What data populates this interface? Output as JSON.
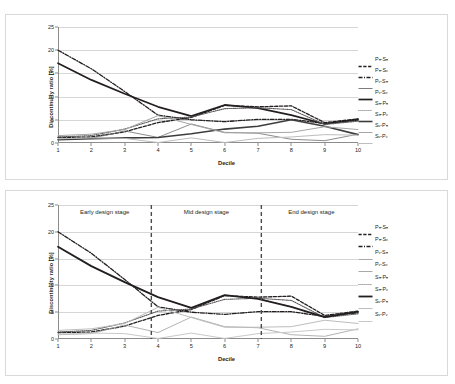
{
  "chart_data": [
    {
      "id": "top",
      "type": "line",
      "title": "",
      "xlabel": "Decile",
      "ylabel": "Discontinuity ratio [%]",
      "xlim": [
        1,
        10
      ],
      "ylim": [
        0,
        25
      ],
      "yticks": [
        0,
        5,
        10,
        15,
        20,
        25
      ],
      "xticks": [
        1,
        2,
        3,
        4,
        5,
        6,
        7,
        8,
        9,
        10
      ],
      "grid": true,
      "legend_position": "right",
      "categories": [
        1,
        2,
        3,
        4,
        5,
        6,
        7,
        8,
        9,
        10
      ],
      "series": [
        {
          "name": "Pₕ-Sₕ",
          "style": "dashed",
          "color": "#231f20",
          "width": 1.3,
          "values": [
            1.2,
            1.3,
            2.4,
            4.4,
            5.5,
            8.1,
            7.8,
            8.0,
            4.4,
            5.2
          ]
        },
        {
          "name": "Pₕ-Sᵥ",
          "style": "dashdot",
          "color": "#231f20",
          "width": 1.3,
          "values": [
            20.0,
            16.0,
            11.1,
            6.0,
            5.0,
            4.6,
            5.1,
            5.1,
            4.2,
            4.9
          ]
        },
        {
          "name": "Pᵥ-Sₕ",
          "style": "solid-thin",
          "color": "#6e6e6e",
          "width": 0.8,
          "values": [
            0.8,
            1.0,
            2.6,
            1.2,
            4.1,
            2.3,
            2.1,
            0.8,
            0.5,
            1.9
          ]
        },
        {
          "name": "Pᵥ-Sᵥ",
          "style": "solid-thick",
          "color": "#231f20",
          "width": 1.7,
          "values": [
            17.2,
            13.6,
            10.6,
            7.8,
            5.8,
            8.2,
            7.5,
            6.0,
            4.1,
            5.1
          ]
        },
        {
          "name": "Sₕ-Pₕ",
          "style": "dotted",
          "color": "#5a5a5a",
          "width": 1.1,
          "values": [
            1.3,
            1.6,
            3.0,
            5.2,
            5.6,
            7.4,
            7.6,
            7.2,
            4.0,
            4.7
          ]
        },
        {
          "name": "Sₕ-Pᵥ",
          "style": "solid-thick",
          "color": "#3d3d3d",
          "width": 1.6,
          "values": [
            0.7,
            0.9,
            1.1,
            1.2,
            2.0,
            3.0,
            3.6,
            5.0,
            3.6,
            1.8
          ]
        },
        {
          "name": "Sᵥ-Pₕ",
          "style": "solid-light",
          "color": "#a6a6a6",
          "width": 1.0,
          "values": [
            1.6,
            1.9,
            2.9,
            5.9,
            4.0,
            2.2,
            2.2,
            2.3,
            3.5,
            2.9
          ]
        },
        {
          "name": "Sᵥ-Pᵥ",
          "style": "solid-light",
          "color": "#bdbdbd",
          "width": 1.0,
          "values": [
            0.9,
            1.1,
            1.0,
            0.1,
            1.1,
            0.1,
            1.0,
            1.3,
            1.8,
            1.7
          ]
        }
      ]
    },
    {
      "id": "bottom",
      "type": "line",
      "title": "",
      "xlabel": "Decile",
      "ylabel": "Discontinuity ratio [%]",
      "xlim": [
        1,
        10
      ],
      "ylim": [
        0,
        25
      ],
      "yticks": [
        0,
        5,
        10,
        15,
        20,
        25
      ],
      "xticks": [
        1,
        2,
        3,
        4,
        5,
        6,
        7,
        8,
        9,
        10
      ],
      "grid": true,
      "legend_position": "right",
      "categories": [
        1,
        2,
        3,
        4,
        5,
        6,
        7,
        8,
        9,
        10
      ],
      "annotations": [
        {
          "label": "Early design stage",
          "x": 2.4
        },
        {
          "label": "Mid design stage",
          "x": 5.45
        },
        {
          "label": "End design stage",
          "x": 8.6
        }
      ],
      "dividers": [
        3.8,
        7.1
      ],
      "series": [
        {
          "name": "Pₕ-Sₕ",
          "style": "dashed",
          "color": "#231f20",
          "width": 1.3,
          "values": [
            1.2,
            1.3,
            2.4,
            4.4,
            5.5,
            8.1,
            7.8,
            8.0,
            4.4,
            5.2
          ]
        },
        {
          "name": "Pₕ-Sᵥ",
          "style": "dashdot",
          "color": "#231f20",
          "width": 1.3,
          "values": [
            20.0,
            16.0,
            11.1,
            6.0,
            5.0,
            4.6,
            5.1,
            5.1,
            4.2,
            4.9
          ]
        },
        {
          "name": "Pᵥ-Sₕ",
          "style": "solid-thin",
          "color": "#9e9e9e",
          "width": 0.8,
          "values": [
            0.8,
            1.0,
            2.6,
            1.2,
            4.1,
            2.3,
            2.1,
            0.8,
            0.5,
            1.9
          ]
        },
        {
          "name": "Pᵥ-Sᵥ",
          "style": "solid-thin",
          "color": "#9e9e9e",
          "width": 0.9,
          "values": [
            17.2,
            13.6,
            10.6,
            7.8,
            5.8,
            8.2,
            7.5,
            6.0,
            4.1,
            5.1
          ]
        },
        {
          "name": "Sₕ-Pₕ",
          "style": "dotted",
          "color": "#5a5a5a",
          "width": 1.1,
          "values": [
            1.3,
            1.6,
            3.0,
            5.2,
            5.6,
            7.4,
            7.6,
            7.2,
            4.0,
            4.7
          ]
        },
        {
          "name": "Sₕ-Pᵥ",
          "style": "solid-thick",
          "color": "#231f20",
          "width": 1.8,
          "values": [
            17.2,
            13.6,
            10.6,
            7.8,
            5.8,
            8.2,
            7.5,
            6.0,
            4.1,
            5.1
          ]
        },
        {
          "name": "Sᵥ-Pₕ",
          "style": "solid-light",
          "color": "#bdbdbd",
          "width": 1.0,
          "values": [
            1.6,
            1.9,
            2.9,
            5.9,
            4.0,
            2.2,
            2.2,
            2.3,
            3.5,
            2.9
          ]
        },
        {
          "name": "Sᵥ-Pᵥ",
          "style": "solid-light",
          "color": "#c9c9c9",
          "width": 1.0,
          "values": [
            0.9,
            1.1,
            1.0,
            0.1,
            1.1,
            0.1,
            1.0,
            1.3,
            1.8,
            1.7
          ]
        }
      ]
    }
  ]
}
